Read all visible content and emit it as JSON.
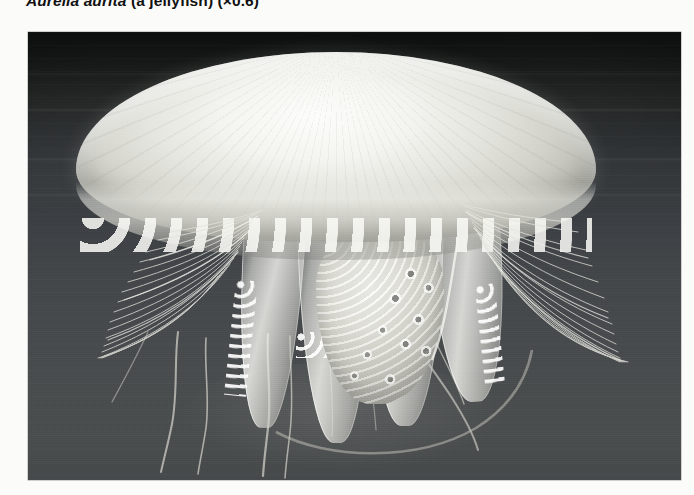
{
  "figure": {
    "caption": {
      "species": "Aurelia aurita",
      "common_name": " (a jellyfish) ",
      "magnification": "(×0.6)"
    },
    "photo": {
      "alt_description": "Grayscale photograph of a moon jellyfish (Aurelia aurita) swimming, showing a broad translucent bell, a dense fringe of fine marginal tentacles, four ribbon-like frilled oral arms and long trailing filaments against dark water.",
      "subject": "moon jellyfish",
      "medium": "black and white photograph",
      "colors": {
        "water_dark": "#0d0f0e",
        "water_mid": "#3d4145",
        "water_light": "#4a4d4d",
        "bell_highlight": "#fdfdfb",
        "bell_shadow": "#878780",
        "page_background": "#fbfbf9",
        "caption_text": "#111111"
      },
      "anatomy": [
        "bell",
        "bell margin lappets",
        "marginal tentacles",
        "oral arms",
        "gonads"
      ]
    }
  }
}
